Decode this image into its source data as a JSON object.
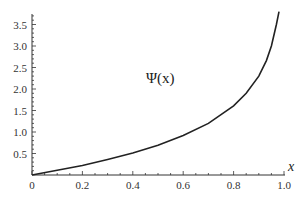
{
  "chart_data": {
    "type": "line",
    "title": "",
    "xlabel": "x",
    "ylabel": "",
    "annotation": "Ψ(x)",
    "xlim": [
      0,
      1.0
    ],
    "ylim": [
      0,
      3.8
    ],
    "x_ticks": [
      "0",
      "0.2",
      "0.4",
      "0.6",
      "0.8",
      "1.0"
    ],
    "y_ticks": [
      "0.5",
      "1.0",
      "1.5",
      "2.0",
      "2.5",
      "3.0",
      "3.5"
    ],
    "grid": false,
    "legend": null,
    "series": [
      {
        "name": "Ψ(x)",
        "x": [
          0,
          0.1,
          0.2,
          0.3,
          0.4,
          0.5,
          0.6,
          0.7,
          0.8,
          0.85,
          0.9,
          0.93,
          0.95,
          0.97,
          0.98
        ],
        "y": [
          0,
          0.11,
          0.22,
          0.36,
          0.51,
          0.69,
          0.92,
          1.2,
          1.61,
          1.9,
          2.3,
          2.66,
          3.0,
          3.5,
          3.8
        ]
      }
    ]
  },
  "labels": {
    "x_axis": "x",
    "annotation": "Ψ(x)"
  }
}
